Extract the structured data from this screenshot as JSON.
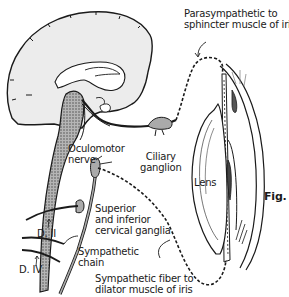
{
  "diagram": {
    "type": "anatomical illustration",
    "figure_label": "Fig.",
    "labels": {
      "parasympathetic_line1": "Parasympathetic to",
      "parasympathetic_line2": "sphincter muscle of iris",
      "oculomotor_line1": "Oculomotor",
      "oculomotor_line2": "nerve",
      "ciliary_line1": "Ciliary",
      "ciliary_line2": "ganglion",
      "lens": "Lens",
      "cervical_line1": "Superior",
      "cervical_line2": "and inferior",
      "cervical_line3": "cervical ganglia",
      "d2": "D. II",
      "d4": "D. IV",
      "chain_line1": "Sympathetic",
      "chain_line2": "chain",
      "symp_fiber_line1": "Sympathetic fiber to",
      "symp_fiber_line2": "dilator muscle of iris"
    },
    "colors": {
      "line": "#1a1a1a",
      "brain_fill": "#ececec",
      "brainstem_fill": "#8a8a8a",
      "background": "#ffffff"
    }
  }
}
